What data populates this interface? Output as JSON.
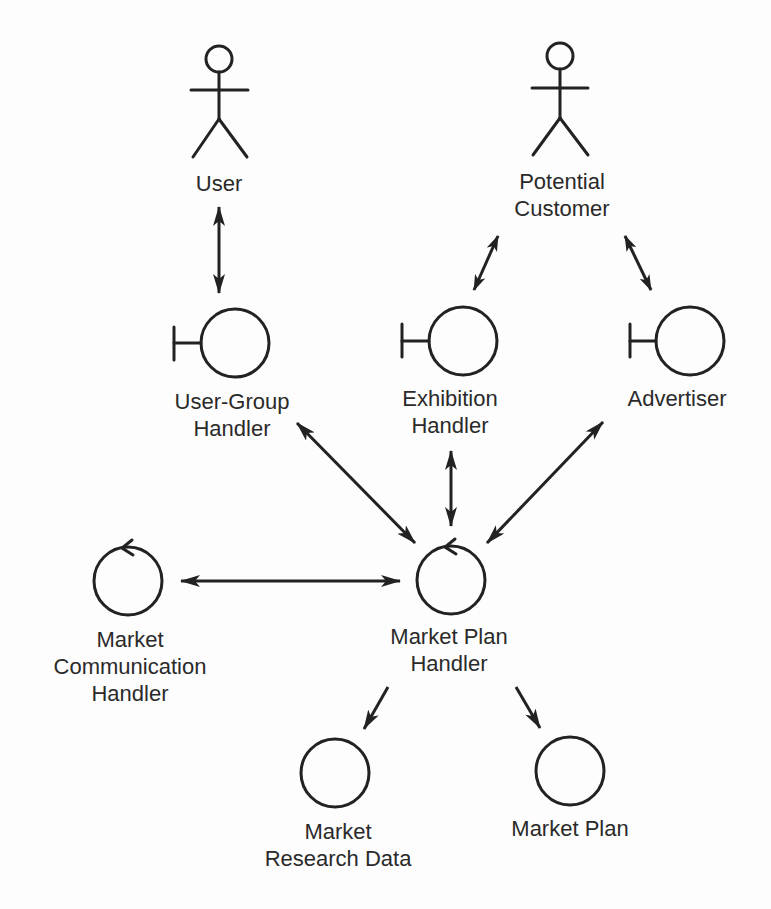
{
  "diagram": {
    "type": "UML robustness / analysis object diagram",
    "colors": {
      "background": "#fdfdfd",
      "stroke": "#222222",
      "text": "#2a2a2a"
    },
    "nodes": [
      {
        "id": "user",
        "kind": "actor",
        "label_lines": [
          "User"
        ]
      },
      {
        "id": "potential_customer",
        "kind": "actor",
        "label_lines": [
          "Potential",
          "Customer"
        ]
      },
      {
        "id": "user_group_handler",
        "kind": "boundary",
        "label_lines": [
          "User-Group",
          "Handler"
        ]
      },
      {
        "id": "exhibition_handler",
        "kind": "boundary",
        "label_lines": [
          "Exhibition",
          "Handler"
        ]
      },
      {
        "id": "advertiser",
        "kind": "boundary",
        "label_lines": [
          "Advertiser"
        ]
      },
      {
        "id": "market_communication_handler",
        "kind": "control",
        "label_lines": [
          "Market",
          "Communication",
          "Handler"
        ]
      },
      {
        "id": "market_plan_handler",
        "kind": "control",
        "label_lines": [
          "Market Plan",
          "Handler"
        ]
      },
      {
        "id": "market_research_data",
        "kind": "entity",
        "label_lines": [
          "Market",
          "Research Data"
        ]
      },
      {
        "id": "market_plan",
        "kind": "entity",
        "label_lines": [
          "Market Plan"
        ]
      }
    ],
    "edges": [
      {
        "from": "user",
        "to": "user_group_handler",
        "direction": "both"
      },
      {
        "from": "potential_customer",
        "to": "exhibition_handler",
        "direction": "both"
      },
      {
        "from": "potential_customer",
        "to": "advertiser",
        "direction": "both"
      },
      {
        "from": "user_group_handler",
        "to": "market_plan_handler",
        "direction": "both"
      },
      {
        "from": "exhibition_handler",
        "to": "market_plan_handler",
        "direction": "both"
      },
      {
        "from": "advertiser",
        "to": "market_plan_handler",
        "direction": "both"
      },
      {
        "from": "market_communication_handler",
        "to": "market_plan_handler",
        "direction": "both"
      },
      {
        "from": "market_plan_handler",
        "to": "market_research_data",
        "direction": "forward"
      },
      {
        "from": "market_plan_handler",
        "to": "market_plan",
        "direction": "forward"
      }
    ]
  },
  "labels": {
    "user": [
      "User"
    ],
    "potential_customer": [
      "Potential",
      "Customer"
    ],
    "user_group_handler": [
      "User-Group",
      "Handler"
    ],
    "exhibition_handler": [
      "Exhibition",
      "Handler"
    ],
    "advertiser": [
      "Advertiser"
    ],
    "market_communication_handler": [
      "Market",
      "Communication",
      "Handler"
    ],
    "market_plan_handler": [
      "Market Plan",
      "Handler"
    ],
    "market_research_data": [
      "Market",
      "Research Data"
    ],
    "market_plan": [
      "Market Plan"
    ]
  }
}
